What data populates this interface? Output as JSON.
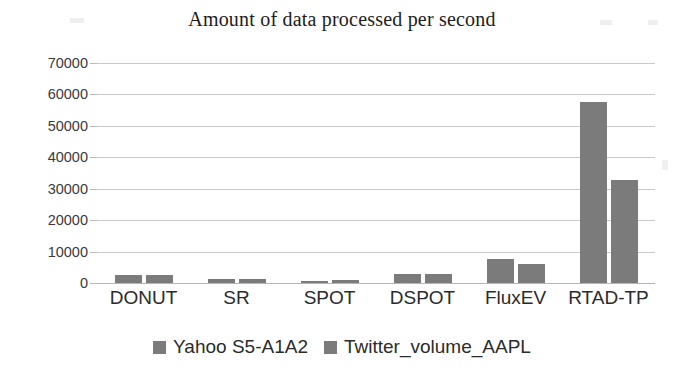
{
  "chart_data": {
    "type": "bar",
    "title": "Amount of data processed per second",
    "xlabel": "",
    "ylabel": "",
    "categories": [
      "DONUT",
      "SR",
      "SPOT",
      "DSPOT",
      "FluxEV",
      "RTAD-TP"
    ],
    "series": [
      {
        "name": "Yahoo S5-A1A2",
        "color": "#7b7b7b",
        "values": [
          2400,
          1200,
          800,
          2900,
          7600,
          57500
        ]
      },
      {
        "name": "Twitter_volume_AAPL",
        "color": "#7b7b7b",
        "values": [
          2400,
          1200,
          900,
          2900,
          6100,
          32700
        ]
      }
    ],
    "ylim": [
      0,
      70000
    ],
    "ytick_values": [
      0,
      10000,
      20000,
      30000,
      40000,
      50000,
      60000,
      70000
    ],
    "ytick_labels": [
      "0",
      "10000",
      "20000",
      "30000",
      "40000",
      "50000",
      "60000",
      "70000"
    ],
    "grid": true,
    "legend_position": "bottom"
  },
  "legend": {
    "entries": [
      {
        "label": "Yahoo S5-A1A2",
        "swatch_icon": "square-marker"
      },
      {
        "label": "Twitter_volume_AAPL",
        "swatch_icon": "square-marker"
      }
    ]
  },
  "colors": {
    "bar": "#7b7b7b",
    "gridline": "#c9c9c9",
    "text": "#2b2b2b",
    "background": "#ffffff"
  }
}
